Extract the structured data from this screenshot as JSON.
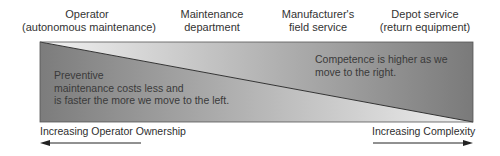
{
  "columns": [
    {
      "line1": "Operator",
      "line2": "(autonomous maintenance)"
    },
    {
      "line1": "Maintenance",
      "line2": "department"
    },
    {
      "line1": "Manufacturer's",
      "line2": "field service"
    },
    {
      "line1": "Depot service",
      "line2": "(return equipment)"
    }
  ],
  "notes": {
    "left": {
      "line1": "Preventive",
      "line2": "maintenance costs less and",
      "line3": "is faster the more we move to the left."
    },
    "right": {
      "line1": "Competence is higher as we",
      "line2": "move to the right."
    }
  },
  "axes": {
    "left": {
      "label": "Increasing Operator Ownership",
      "direction": "left"
    },
    "right": {
      "label": "Increasing Complexity",
      "direction": "right"
    }
  },
  "colors": {
    "dark": "#7a7a7a",
    "light": "#ececec",
    "line": "#333333"
  }
}
